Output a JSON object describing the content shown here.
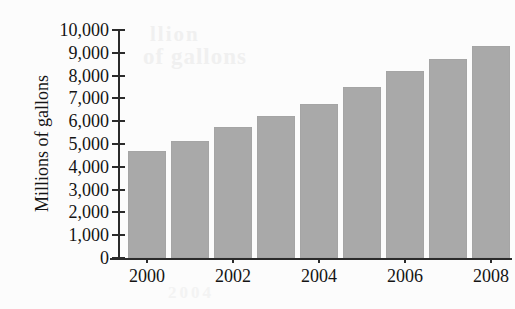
{
  "chart_data": {
    "type": "bar",
    "title": "",
    "xlabel": "",
    "ylabel": "Millions of gallons",
    "categories": [
      "2000",
      "2001",
      "2002",
      "2003",
      "2004",
      "2005",
      "2006",
      "2007",
      "2008"
    ],
    "values": [
      4700,
      5150,
      5750,
      6250,
      6750,
      7500,
      8200,
      8750,
      9300
    ],
    "ylim": [
      0,
      10000
    ],
    "yticks": [
      0,
      1000,
      2000,
      3000,
      4000,
      5000,
      6000,
      7000,
      8000,
      9000,
      10000
    ],
    "ytick_labels": [
      "0",
      "1,000",
      "2,000",
      "3,000",
      "4,000",
      "5,000",
      "6,000",
      "7,000",
      "8,000",
      "9,000",
      "10,000"
    ],
    "xtick_labels": [
      "2000",
      "2002",
      "2004",
      "2006",
      "2008"
    ],
    "xtick_categories": [
      "2000",
      "2002",
      "2004",
      "2006",
      "2008"
    ],
    "grid": false,
    "legend": false,
    "bar_color": "#a9a9a9",
    "axis_color": "#2b2b2b",
    "background_color": "#fcfcfc"
  },
  "artifacts": {
    "showthrough_1": "llion",
    "showthrough_2": "of gallons",
    "showthrough_3": "2004"
  }
}
